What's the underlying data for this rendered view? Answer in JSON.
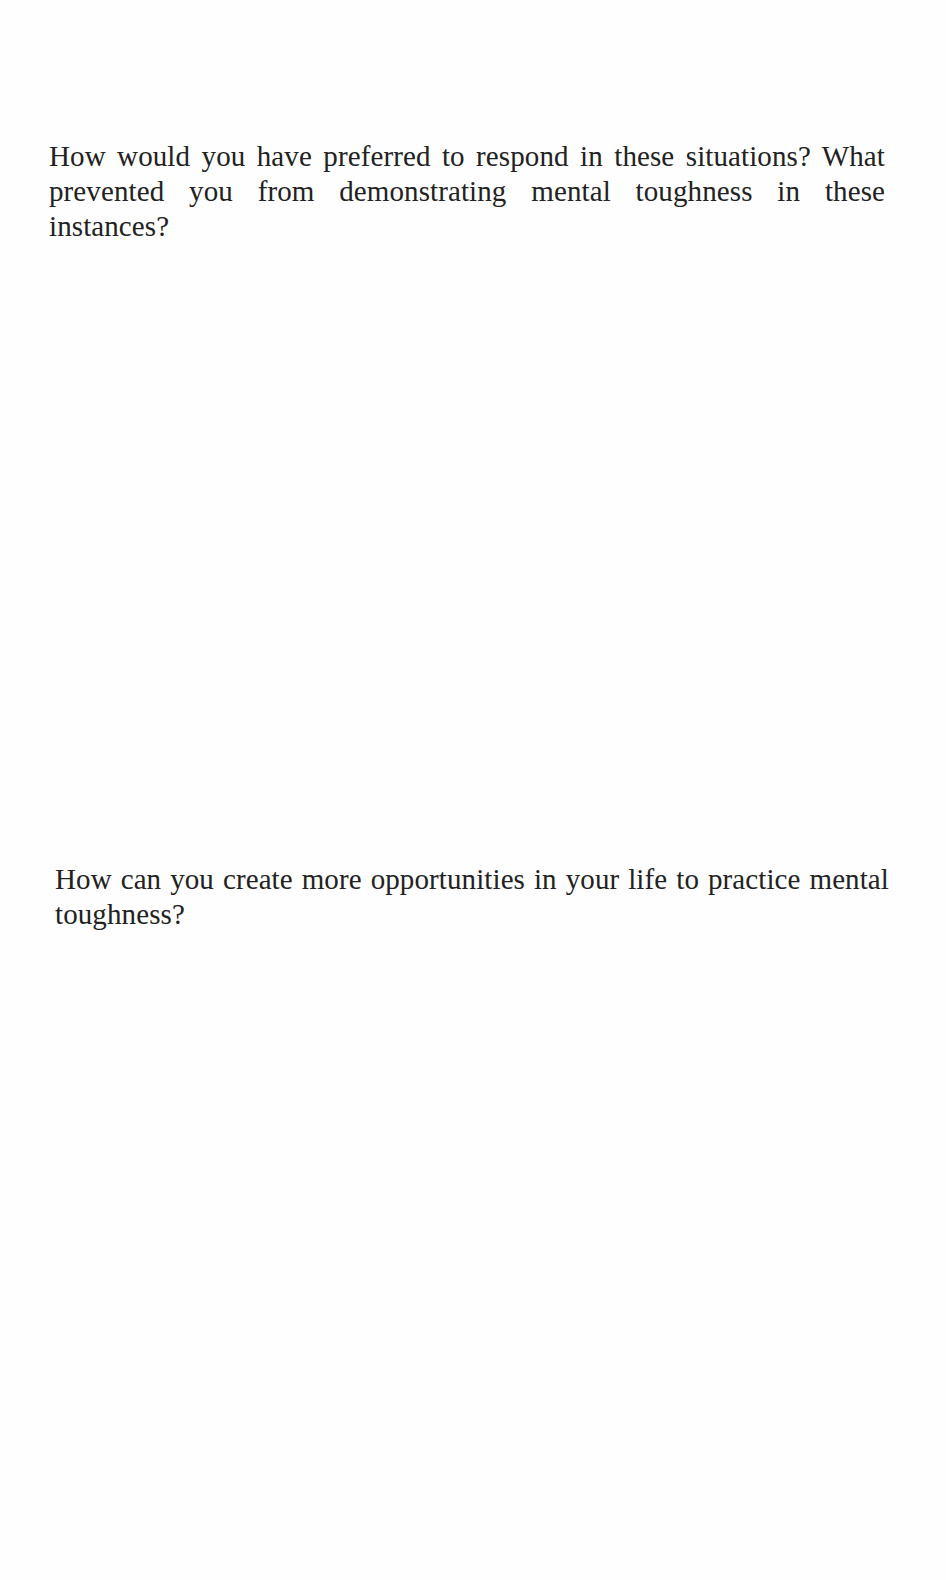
{
  "page": {
    "prompts": [
      {
        "text": "How would you have preferred to respond in these situations? What prevented you from demonstrating mental toughness in these instances?"
      },
      {
        "text": "How can you create more opportunities in your life to practice mental toughness?"
      }
    ]
  }
}
